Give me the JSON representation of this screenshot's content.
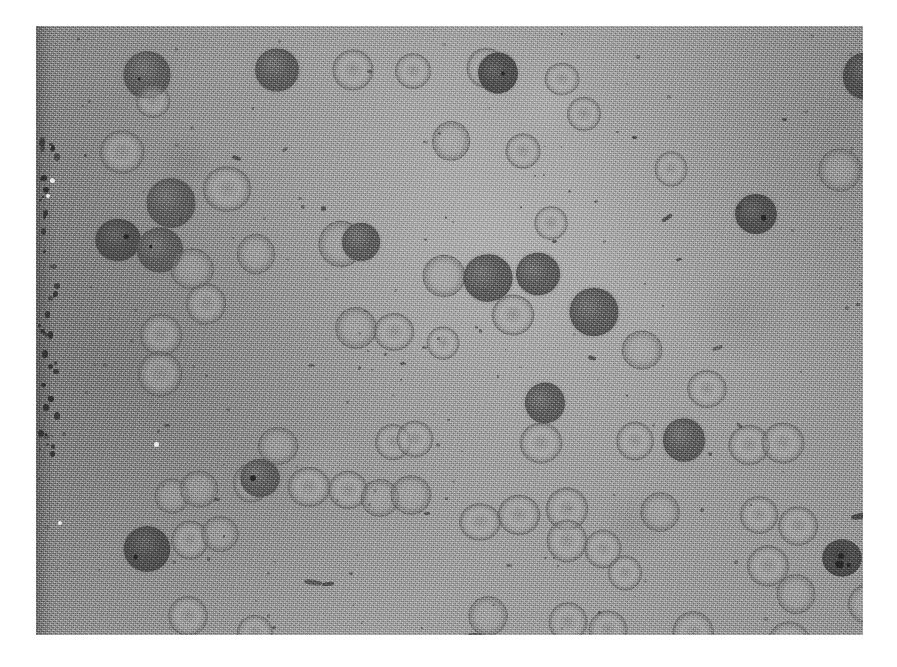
{
  "page": {
    "background_color": "#ffffff",
    "width": 897,
    "height": 667
  },
  "micrograph": {
    "title": "",
    "caption": "",
    "modality": "brightfield light micrograph",
    "subject": "blood smear — erythrocytes and darkly stained cells",
    "frame": {
      "x": 36,
      "y": 26,
      "width": 827,
      "height": 609
    },
    "colors": {
      "background_field": "#9e9e9e",
      "field_light": "#adadad",
      "field_dark": "#8c8c8c",
      "dark_cell": "#646464",
      "darkest_cell": "#555555",
      "cell_rim": "#4e4e4e",
      "cell_interior": "#b0b0b0",
      "plate_border": "#8a8a8a",
      "page": "#ffffff"
    },
    "artifacts": {
      "left_edge_band": {
        "x": 0,
        "width": 22,
        "note": "vertical emulsion scratch with dark specks"
      }
    },
    "cells": [
      {
        "id": 1,
        "x": 88,
        "y": 26,
        "d": 46,
        "type": "dark"
      },
      {
        "id": 2,
        "x": 219,
        "y": 22,
        "d": 44,
        "type": "dark"
      },
      {
        "id": 3,
        "x": 297,
        "y": 24,
        "d": 40,
        "type": "ring"
      },
      {
        "id": 4,
        "x": 358,
        "y": 26,
        "d": 38,
        "type": "ring"
      },
      {
        "id": 5,
        "x": 430,
        "y": 22,
        "d": 40,
        "type": "ring"
      },
      {
        "id": 6,
        "x": 441,
        "y": 26,
        "d": 42,
        "type": "dark"
      },
      {
        "id": 7,
        "x": 509,
        "y": 36,
        "d": 34,
        "type": "ring"
      },
      {
        "id": 8,
        "x": 530,
        "y": 70,
        "d": 36,
        "type": "ring"
      },
      {
        "id": 9,
        "x": 806,
        "y": 28,
        "d": 44,
        "type": "dark"
      },
      {
        "id": 10,
        "x": 843,
        "y": 34,
        "d": 38,
        "type": "ring"
      },
      {
        "id": 11,
        "x": 100,
        "y": 58,
        "d": 34,
        "type": "ring"
      },
      {
        "id": 12,
        "x": 64,
        "y": 104,
        "d": 44,
        "type": "ring"
      },
      {
        "id": 13,
        "x": 168,
        "y": 140,
        "d": 46,
        "type": "ring"
      },
      {
        "id": 14,
        "x": 110,
        "y": 152,
        "d": 50,
        "type": "dark"
      },
      {
        "id": 15,
        "x": 60,
        "y": 192,
        "d": 44,
        "type": "dark"
      },
      {
        "id": 16,
        "x": 100,
        "y": 200,
        "d": 48,
        "type": "dark"
      },
      {
        "id": 17,
        "x": 135,
        "y": 222,
        "d": 42,
        "type": "crenate"
      },
      {
        "id": 18,
        "x": 200,
        "y": 208,
        "d": 40,
        "type": "crenate"
      },
      {
        "id": 19,
        "x": 283,
        "y": 196,
        "d": 44,
        "type": "crenate"
      },
      {
        "id": 20,
        "x": 305,
        "y": 196,
        "d": 40,
        "type": "dark"
      },
      {
        "id": 21,
        "x": 386,
        "y": 228,
        "d": 44,
        "type": "crenate"
      },
      {
        "id": 22,
        "x": 428,
        "y": 228,
        "d": 48,
        "type": "dark"
      },
      {
        "id": 23,
        "x": 480,
        "y": 226,
        "d": 44,
        "type": "dark"
      },
      {
        "id": 24,
        "x": 456,
        "y": 268,
        "d": 42,
        "type": "ring"
      },
      {
        "id": 25,
        "x": 534,
        "y": 262,
        "d": 48,
        "type": "dark"
      },
      {
        "id": 26,
        "x": 104,
        "y": 288,
        "d": 42,
        "type": "ring"
      },
      {
        "id": 27,
        "x": 102,
        "y": 326,
        "d": 44,
        "type": "ring"
      },
      {
        "id": 28,
        "x": 300,
        "y": 282,
        "d": 40,
        "type": "crenate"
      },
      {
        "id": 29,
        "x": 338,
        "y": 286,
        "d": 40,
        "type": "ring"
      },
      {
        "id": 30,
        "x": 586,
        "y": 304,
        "d": 40,
        "type": "crenate"
      },
      {
        "id": 31,
        "x": 652,
        "y": 344,
        "d": 38,
        "type": "ring"
      },
      {
        "id": 32,
        "x": 488,
        "y": 356,
        "d": 42,
        "type": "dark"
      },
      {
        "id": 33,
        "x": 222,
        "y": 400,
        "d": 40,
        "type": "crenate"
      },
      {
        "id": 34,
        "x": 339,
        "y": 398,
        "d": 36,
        "type": "ring"
      },
      {
        "id": 35,
        "x": 360,
        "y": 394,
        "d": 38,
        "type": "ring"
      },
      {
        "id": 36,
        "x": 484,
        "y": 396,
        "d": 42,
        "type": "ring"
      },
      {
        "id": 37,
        "x": 580,
        "y": 396,
        "d": 38,
        "type": "ring"
      },
      {
        "id": 38,
        "x": 626,
        "y": 392,
        "d": 44,
        "type": "dark"
      },
      {
        "id": 39,
        "x": 692,
        "y": 398,
        "d": 42,
        "type": "ring"
      },
      {
        "id": 40,
        "x": 726,
        "y": 396,
        "d": 42,
        "type": "ring"
      },
      {
        "id": 41,
        "x": 838,
        "y": 400,
        "d": 38,
        "type": "ring"
      },
      {
        "id": 42,
        "x": 196,
        "y": 438,
        "d": 38,
        "type": "ring"
      },
      {
        "id": 43,
        "x": 204,
        "y": 432,
        "d": 40,
        "type": "dark"
      },
      {
        "id": 44,
        "x": 118,
        "y": 452,
        "d": 36,
        "type": "crenate"
      },
      {
        "id": 45,
        "x": 144,
        "y": 444,
        "d": 38,
        "type": "crenate"
      },
      {
        "id": 46,
        "x": 252,
        "y": 440,
        "d": 42,
        "type": "ring"
      },
      {
        "id": 47,
        "x": 292,
        "y": 444,
        "d": 40,
        "type": "ring"
      },
      {
        "id": 48,
        "x": 324,
        "y": 452,
        "d": 40,
        "type": "crenate"
      },
      {
        "id": 49,
        "x": 354,
        "y": 448,
        "d": 42,
        "type": "crenate"
      },
      {
        "id": 50,
        "x": 462,
        "y": 468,
        "d": 42,
        "type": "ring"
      },
      {
        "id": 51,
        "x": 510,
        "y": 462,
        "d": 42,
        "type": "ring"
      },
      {
        "id": 52,
        "x": 604,
        "y": 466,
        "d": 40,
        "type": "crenate"
      },
      {
        "id": 53,
        "x": 704,
        "y": 470,
        "d": 38,
        "type": "ring"
      },
      {
        "id": 54,
        "x": 742,
        "y": 480,
        "d": 40,
        "type": "ring"
      },
      {
        "id": 55,
        "x": 836,
        "y": 472,
        "d": 38,
        "type": "dark"
      },
      {
        "id": 56,
        "x": 786,
        "y": 512,
        "d": 40,
        "type": "speckled"
      },
      {
        "id": 57,
        "x": 88,
        "y": 500,
        "d": 46,
        "type": "dark"
      },
      {
        "id": 58,
        "x": 135,
        "y": 495,
        "d": 38,
        "type": "ring"
      },
      {
        "id": 59,
        "x": 424,
        "y": 476,
        "d": 40,
        "type": "ring"
      },
      {
        "id": 60,
        "x": 510,
        "y": 494,
        "d": 42,
        "type": "ring"
      },
      {
        "id": 61,
        "x": 548,
        "y": 504,
        "d": 38,
        "type": "ring"
      },
      {
        "id": 62,
        "x": 572,
        "y": 530,
        "d": 34,
        "type": "ring"
      },
      {
        "id": 63,
        "x": 712,
        "y": 520,
        "d": 40,
        "type": "ring"
      },
      {
        "id": 64,
        "x": 740,
        "y": 548,
        "d": 40,
        "type": "crenate"
      },
      {
        "id": 65,
        "x": 812,
        "y": 556,
        "d": 44,
        "type": "ring"
      },
      {
        "id": 66,
        "x": 132,
        "y": 570,
        "d": 40,
        "type": "ring"
      },
      {
        "id": 67,
        "x": 200,
        "y": 588,
        "d": 38,
        "type": "ring"
      },
      {
        "id": 68,
        "x": 432,
        "y": 570,
        "d": 40,
        "type": "crenate"
      },
      {
        "id": 69,
        "x": 512,
        "y": 576,
        "d": 40,
        "type": "ring"
      },
      {
        "id": 70,
        "x": 552,
        "y": 584,
        "d": 40,
        "type": "ring"
      },
      {
        "id": 71,
        "x": 636,
        "y": 586,
        "d": 42,
        "type": "ring"
      },
      {
        "id": 72,
        "x": 732,
        "y": 596,
        "d": 42,
        "type": "ring"
      },
      {
        "id": 73,
        "x": 416,
        "y": 606,
        "d": 46,
        "type": "dark"
      },
      {
        "id": 74,
        "x": 618,
        "y": 126,
        "d": 34,
        "type": "ring"
      },
      {
        "id": 75,
        "x": 700,
        "y": 168,
        "d": 40,
        "type": "dark"
      },
      {
        "id": 76,
        "x": 396,
        "y": 96,
        "d": 38,
        "type": "crenate"
      },
      {
        "id": 77,
        "x": 470,
        "y": 108,
        "d": 34,
        "type": "ring"
      },
      {
        "id": 78,
        "x": 498,
        "y": 180,
        "d": 34,
        "type": "ring"
      },
      {
        "id": 79,
        "x": 782,
        "y": 122,
        "d": 44,
        "type": "crenate"
      },
      {
        "id": 80,
        "x": 833,
        "y": 116,
        "d": 40,
        "type": "ring"
      },
      {
        "id": 81,
        "x": 150,
        "y": 258,
        "d": 40,
        "type": "ring"
      },
      {
        "id": 82,
        "x": 390,
        "y": 300,
        "d": 34,
        "type": "ring"
      },
      {
        "id": 83,
        "x": 166,
        "y": 490,
        "d": 36,
        "type": "crenate"
      }
    ]
  }
}
